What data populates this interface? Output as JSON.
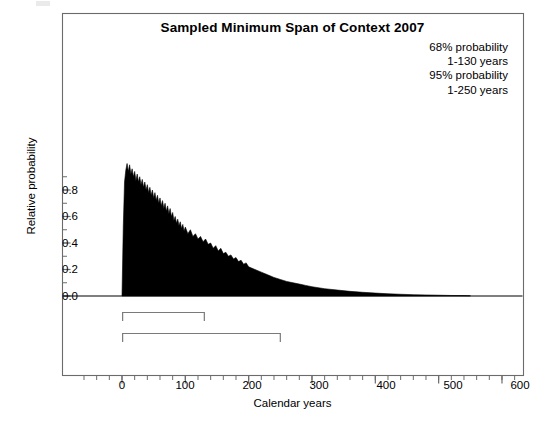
{
  "chart_data": {
    "type": "area",
    "title": "Sampled Minimum Span of Context 2007",
    "xlabel": "Calendar years",
    "ylabel": "Relative probability",
    "xlim": [
      -60,
      620
    ],
    "ylim": [
      -0.38,
      1.12
    ],
    "grid": false,
    "legend_position": "none",
    "xticks_major": [
      0,
      100,
      200,
      300,
      400,
      500,
      600
    ],
    "xtick_labels": [
      "0",
      "100",
      "200",
      "300",
      "400",
      "500",
      "600"
    ],
    "xticks_minor_step": 20,
    "yticks_major": [
      0.0,
      0.2,
      0.4,
      0.6,
      0.8
    ],
    "ytick_labels": [
      "0.0",
      "0.2",
      "0.4",
      "0.6",
      "0.8"
    ],
    "yticks_minor_step": 0.1,
    "x": [
      0,
      2,
      4,
      6,
      8,
      10,
      12,
      14,
      16,
      18,
      20,
      22,
      24,
      26,
      28,
      30,
      32,
      34,
      36,
      38,
      40,
      42,
      44,
      46,
      48,
      50,
      52,
      54,
      56,
      58,
      60,
      62,
      64,
      66,
      68,
      70,
      72,
      74,
      76,
      78,
      80,
      82,
      84,
      86,
      88,
      90,
      92,
      94,
      96,
      98,
      100,
      104,
      108,
      112,
      116,
      120,
      124,
      128,
      132,
      136,
      140,
      144,
      148,
      152,
      156,
      160,
      164,
      168,
      172,
      176,
      180,
      184,
      188,
      192,
      196,
      200,
      210,
      220,
      230,
      240,
      250,
      260,
      270,
      280,
      290,
      300,
      320,
      340,
      360,
      380,
      400,
      420,
      440,
      460,
      480,
      500,
      520,
      540,
      550
    ],
    "values": [
      0.0,
      0.52,
      0.86,
      0.95,
      1.0,
      0.94,
      0.99,
      0.92,
      0.96,
      0.9,
      0.94,
      0.87,
      0.92,
      0.86,
      0.9,
      0.84,
      0.88,
      0.82,
      0.86,
      0.8,
      0.84,
      0.78,
      0.82,
      0.76,
      0.8,
      0.74,
      0.78,
      0.72,
      0.76,
      0.7,
      0.74,
      0.68,
      0.72,
      0.66,
      0.7,
      0.64,
      0.68,
      0.62,
      0.66,
      0.6,
      0.63,
      0.57,
      0.6,
      0.55,
      0.58,
      0.53,
      0.56,
      0.51,
      0.54,
      0.49,
      0.52,
      0.47,
      0.5,
      0.45,
      0.47,
      0.43,
      0.45,
      0.41,
      0.43,
      0.39,
      0.4,
      0.36,
      0.38,
      0.34,
      0.36,
      0.32,
      0.33,
      0.3,
      0.31,
      0.28,
      0.29,
      0.26,
      0.27,
      0.24,
      0.25,
      0.22,
      0.2,
      0.18,
      0.16,
      0.14,
      0.125,
      0.11,
      0.1,
      0.09,
      0.08,
      0.07,
      0.055,
      0.045,
      0.035,
      0.028,
      0.022,
      0.017,
      0.013,
      0.01,
      0.008,
      0.006,
      0.004,
      0.003,
      0.002
    ],
    "series_color": "#000000",
    "ranges": [
      {
        "name": "68% probability",
        "label": "1-130 years",
        "start": 1,
        "end": 130,
        "row": 0
      },
      {
        "name": "95% probability",
        "label": "1-250 years",
        "start": 1,
        "end": 250,
        "row": 1
      }
    ],
    "annotation_lines": [
      "68% probability",
      "1-130 years",
      "95% probability",
      "1-250 years"
    ]
  },
  "figure": {
    "title": "Sampled Minimum Span of Context 2007",
    "xlabel": "Calendar years",
    "ylabel": "Relative probability",
    "annotation": {
      "line1": "68% probability",
      "line2": "1-130 years",
      "line3": "95% probability",
      "line4": "1-250 years"
    },
    "xtick_labels": {
      "t0": "0",
      "t1": "100",
      "t2": "200",
      "t3": "300",
      "t4": "400",
      "t5": "500",
      "t6": "600"
    },
    "ytick_labels": {
      "t0": "0.0",
      "t1": "0.2",
      "t2": "0.4",
      "t3": "0.6",
      "t4": "0.8"
    },
    "colors": {
      "background": "#ffffff",
      "axis": "#6b6b6b",
      "data": "#000000",
      "bracket": "#7a7a7a",
      "text": "#000000"
    }
  }
}
